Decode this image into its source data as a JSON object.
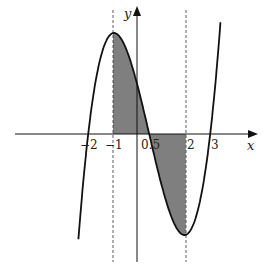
{
  "chart_data": {
    "type": "line",
    "title": "",
    "xlabel": "x",
    "ylabel": "y",
    "function": "cubic with zeros at x = -2, 0.5, 3; local max at x = -1, local min at x = 2",
    "zeros": [
      -2,
      0.5,
      3
    ],
    "local_max_x": -1,
    "local_min_x": 2,
    "x_tick_labels": [
      "-2",
      "-1",
      "0.5",
      "2",
      "3"
    ],
    "dashed_vertical_lines_x": [
      -1,
      2
    ],
    "shaded_region": {
      "from_x": -1,
      "to_x": 2,
      "between": "curve and x-axis"
    },
    "grid": false,
    "colors": {
      "curve": "#111111",
      "shade": "#808080",
      "axis": "#111111"
    }
  },
  "labels": {
    "x_axis": "x",
    "y_axis": "y",
    "ticks": [
      "−2",
      "−1",
      "0.5",
      "2",
      "3"
    ]
  }
}
